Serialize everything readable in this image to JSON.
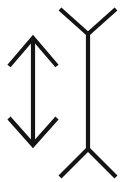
{
  "figure": {
    "type": "line-drawing",
    "background_color": "#ffffff",
    "stroke_color": "#141414",
    "stroke_width_px": 4.2,
    "canvas": {
      "width_px": 123,
      "height_px": 182
    },
    "glyph_count": 2
  },
  "glyphs": [
    {
      "id": "double-headed-arrow",
      "name": "Double-headed vertical arrow",
      "description": "Vertical shaft with an upward chevron arrowhead at the top and a downward chevron arrowhead at the bottom.",
      "bounds": {
        "x": 8,
        "y": 36,
        "width": 50,
        "height": 111
      },
      "parts": [
        {
          "part": "shaft",
          "kind": "line",
          "points": [
            [
              33,
              38
            ],
            [
              33,
              145
            ]
          ]
        },
        {
          "part": "upper-arrowhead",
          "kind": "polyline",
          "points": [
            [
              9,
              66
            ],
            [
              33,
              38
            ],
            [
              57,
              66
            ]
          ]
        },
        {
          "part": "lower-arrowhead",
          "kind": "polyline",
          "points": [
            [
              9,
              118
            ],
            [
              33,
              145
            ],
            [
              57,
              118
            ]
          ]
        }
      ]
    },
    {
      "id": "double-forked-stem",
      "name": "Double-forked vertical stem",
      "description": "Vertical stem with a Y fork opening upward at the top and an inverted Y fork opening downward at the bottom.",
      "bounds": {
        "x": 59,
        "y": 8,
        "width": 59,
        "height": 170
      },
      "parts": [
        {
          "part": "stem",
          "kind": "line",
          "points": [
            [
              88,
              34
            ],
            [
              88,
              149
            ]
          ]
        },
        {
          "part": "upper-fork",
          "kind": "polyline",
          "points": [
            [
              60,
              9
            ],
            [
              88,
              34
            ],
            [
              116,
              9
            ]
          ]
        },
        {
          "part": "lower-fork",
          "kind": "polyline",
          "points": [
            [
              60,
              177
            ],
            [
              88,
              149
            ],
            [
              116,
              177
            ]
          ]
        }
      ]
    }
  ],
  "labels": {
    "alt_text": "Black line drawing of a double-headed arrow beside a vertical stem forked at both ends"
  }
}
